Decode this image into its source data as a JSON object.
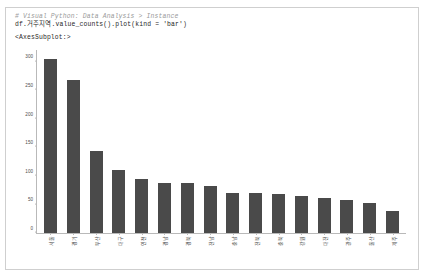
{
  "cell": {
    "code_comment": "# Visual Python: Data Analysis > Instance",
    "code_statement": "df.거주지역.value_counts().plot(kind = 'bar')",
    "output_text": "<AxesSubplot:>"
  },
  "chart_data": {
    "type": "bar",
    "title": "",
    "xlabel": "",
    "ylabel": "",
    "ylim": [
      0,
      320
    ],
    "grid": false,
    "legend": null,
    "bar_color": "#4a4a4a",
    "axis_color": "#b9b9b9",
    "ytick_labels": [
      "0",
      "50",
      "100",
      "150",
      "200",
      "250",
      "300"
    ],
    "ytick_values": [
      0,
      50,
      100,
      150,
      200,
      250,
      300
    ],
    "categories": [
      "서울",
      "경기",
      "부산",
      "대구",
      "인천",
      "경남",
      "경북",
      "전남",
      "충남",
      "전북",
      "충북",
      "강원",
      "대전",
      "광주",
      "울산",
      "제주"
    ],
    "values": [
      305,
      267,
      143,
      110,
      95,
      88,
      88,
      83,
      70,
      70,
      68,
      65,
      62,
      57,
      52,
      38
    ]
  }
}
